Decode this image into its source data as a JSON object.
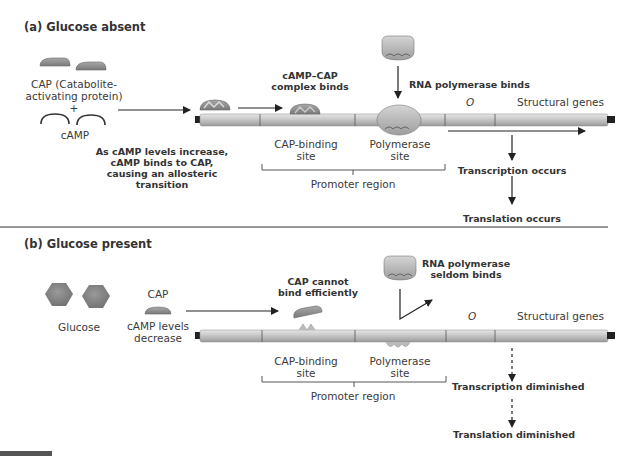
{
  "panel_a": {
    "title": "(a) Glucose absent",
    "cap_label_line1": "CAP (Catabolite-",
    "cap_label_line2": "activating protein)",
    "plus": "+",
    "camp_label": "cAMP",
    "allosteric_line1": "As cAMP levels increase,",
    "allosteric_line2": "cAMP binds to CAP,",
    "allosteric_line3": "causing an allosteric",
    "allosteric_line4": "transition",
    "complex_binds_line1": "cAMP–CAP",
    "complex_binds_line2": "complex binds",
    "rnap_binds": "RNA polymerase binds",
    "operator": "O",
    "structural_genes": "Structural genes",
    "cap_site_line1": "CAP-binding",
    "cap_site_line2": "site",
    "pol_site_line1": "Polymerase",
    "pol_site_line2": "site",
    "promoter_region": "Promoter region",
    "transcription": "Transcription occurs",
    "translation": "Translation occurs"
  },
  "panel_b": {
    "title": "(b) Glucose present",
    "glucose_label": "Glucose",
    "cap_label": "CAP",
    "camp_line1": "cAMP levels",
    "camp_line2": "decrease",
    "cannot_bind_line1": "CAP cannot",
    "cannot_bind_line2": "bind efficiently",
    "rnap_line1": "RNA polymerase",
    "rnap_line2": "seldom binds",
    "operator": "O",
    "structural_genes": "Structural genes",
    "cap_site_line1": "CAP-binding",
    "cap_site_line2": "site",
    "pol_site_line1": "Polymerase",
    "pol_site_line2": "site",
    "promoter_region": "Promoter region",
    "transcription": "Transcription diminished",
    "translation": "Translation diminished"
  },
  "colors": {
    "cap_protein": "#8d8d8d",
    "dna_strand": "#c9c9c9",
    "glucose": "#7d7d7d",
    "rna_polymerase": "#bdbdbd",
    "text": "#3a3a3a"
  }
}
